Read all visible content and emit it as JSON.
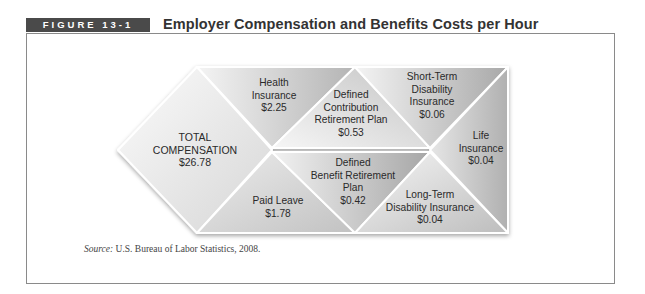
{
  "figure": {
    "label": "FIGURE 13-1",
    "title": "Employer Compensation and Benefits Costs per Hour"
  },
  "diagram": {
    "total": {
      "lines": [
        "TOTAL",
        "COMPENSATION",
        "$26.78"
      ],
      "label": "Total Compensation",
      "value": "$26.78"
    },
    "segments": [
      {
        "id": "health-insurance",
        "lines": [
          "Health",
          "Insurance",
          "$2.25"
        ],
        "label": "Health Insurance",
        "value": "$2.25"
      },
      {
        "id": "defined-contribution",
        "lines": [
          "Defined",
          "Contribution",
          "Retirement Plan",
          "$0.53"
        ],
        "label": "Defined Contribution Retirement Plan",
        "value": "$0.53"
      },
      {
        "id": "short-term-disability",
        "lines": [
          "Short-Term",
          "Disability",
          "Insurance",
          "$0.06"
        ],
        "label": "Short-Term Disability Insurance",
        "value": "$0.06"
      },
      {
        "id": "life-insurance",
        "lines": [
          "Life",
          "Insurance",
          "$0.04"
        ],
        "label": "Life Insurance",
        "value": "$0.04"
      },
      {
        "id": "paid-leave",
        "lines": [
          "Paid Leave",
          "$1.78"
        ],
        "label": "Paid Leave",
        "value": "$1.78"
      },
      {
        "id": "defined-benefit",
        "lines": [
          "Defined",
          "Benefit Retirement",
          "Plan",
          "$0.42"
        ],
        "label": "Defined Benefit Retirement Plan",
        "value": "$0.42"
      },
      {
        "id": "long-term-disability",
        "lines": [
          "Long-Term",
          "Disability Insurance",
          "$0.04"
        ],
        "label": "Long-Term Disability Insurance",
        "value": "$0.04"
      }
    ]
  },
  "source": {
    "prefix": "Source:",
    "text": " U.S. Bureau of Labor Statistics, 2008."
  },
  "colors": {
    "label_bg": "#4a4a4a",
    "frame": "#8a8a8a",
    "tile_light": "#f2f2f2",
    "tile_dark": "#a9a9a9"
  }
}
